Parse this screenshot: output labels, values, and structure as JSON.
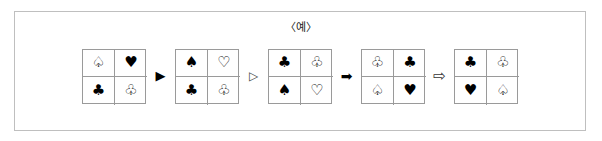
{
  "caption": "〈예〉",
  "colors": {
    "frame_border": "#bfbfbf",
    "grid_border": "#9a9a9a",
    "glyph": "#000000",
    "background": "#ffffff"
  },
  "sequence": {
    "grids": [
      {
        "name": "grid-1",
        "cells": [
          {
            "symbol": "spade-outline",
            "glyph": "♤"
          },
          {
            "symbol": "heart-filled",
            "glyph": "♥"
          },
          {
            "symbol": "club-filled",
            "glyph": "♣"
          },
          {
            "symbol": "club-outline",
            "glyph": "♧"
          }
        ]
      },
      {
        "name": "grid-2",
        "cells": [
          {
            "symbol": "spade-filled",
            "glyph": "♠"
          },
          {
            "symbol": "heart-outline",
            "glyph": "♡"
          },
          {
            "symbol": "club-filled",
            "glyph": "♣"
          },
          {
            "symbol": "club-outline",
            "glyph": "♧"
          }
        ]
      },
      {
        "name": "grid-3",
        "cells": [
          {
            "symbol": "club-filled",
            "glyph": "♣"
          },
          {
            "symbol": "club-outline",
            "glyph": "♧"
          },
          {
            "symbol": "spade-filled",
            "glyph": "♠"
          },
          {
            "symbol": "heart-outline",
            "glyph": "♡"
          }
        ]
      },
      {
        "name": "grid-4",
        "cells": [
          {
            "symbol": "club-outline",
            "glyph": "♧"
          },
          {
            "symbol": "club-filled",
            "glyph": "♣"
          },
          {
            "symbol": "spade-outline",
            "glyph": "♤"
          },
          {
            "symbol": "heart-filled",
            "glyph": "♥"
          }
        ]
      },
      {
        "name": "grid-5",
        "cells": [
          {
            "symbol": "club-filled",
            "glyph": "♣"
          },
          {
            "symbol": "club-outline",
            "glyph": "♧"
          },
          {
            "symbol": "heart-filled",
            "glyph": "♥"
          },
          {
            "symbol": "spade-outline",
            "glyph": "♤"
          }
        ]
      }
    ],
    "arrows": [
      {
        "name": "solid-triangle-right-icon",
        "glyph": "▶",
        "style": "solid-tri"
      },
      {
        "name": "hollow-triangle-right-icon",
        "glyph": "▷",
        "style": "hollow-tri"
      },
      {
        "name": "solid-arrow-right-icon",
        "glyph": "➡",
        "style": "solid-arr"
      },
      {
        "name": "hollow-arrow-right-icon",
        "glyph": "⇨",
        "style": "hollow-arr"
      }
    ]
  }
}
